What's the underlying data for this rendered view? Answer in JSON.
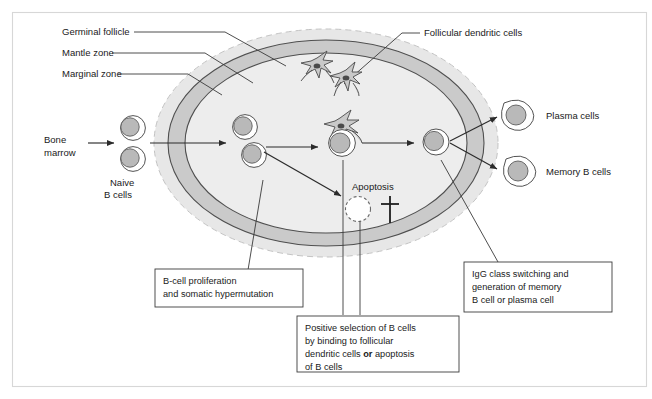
{
  "figure": {
    "background": "#ffffff",
    "frame_color": "#d7d7d7"
  },
  "zones": {
    "marginal": {
      "label": "Marginal zone",
      "fill": "#e6e6e6",
      "stroke": "#bdbdbd",
      "style": "dashed"
    },
    "mantle": {
      "label": "Mantle zone",
      "fill": "#c9c9c9",
      "stroke": "#555555",
      "style": "solid"
    },
    "germinal": {
      "label": "Germinal follicle",
      "fill": "#ededed",
      "stroke": "#555555",
      "style": "solid"
    }
  },
  "labels": {
    "germinal_follicle": "Germinal follicle",
    "mantle_zone": "Mantle zone",
    "marginal_zone": "Marginal zone",
    "follicular_dendritic_cells": "Follicular dendritic cells",
    "bone_marrow_line1": "Bone",
    "bone_marrow_line2": "marrow",
    "naive_line1": "Naive",
    "naive_line2": "B cells",
    "apoptosis": "Apoptosis",
    "plasma_cells": "Plasma cells",
    "memory_b_cells": "Memory B cells"
  },
  "boxes": {
    "proliferation": {
      "lines": [
        "B-cell proliferation",
        "and somatic hypermutation"
      ]
    },
    "positive_selection": {
      "lines": [
        {
          "text": "Positive selection of B cells"
        },
        {
          "text": "by binding to follicular"
        },
        {
          "pre": "dendritic cells ",
          "bold": "or",
          "post": " apoptosis"
        },
        {
          "text": "of B cells"
        }
      ]
    },
    "igg_switching": {
      "lines": [
        "IgG class switching and",
        "generation of memory",
        "B cell or plasma cell"
      ]
    }
  },
  "icons": {
    "death_cross": "dagger-cross-icon",
    "dendritic": "dendritic-cell-icon",
    "b_cell": "b-cell-icon",
    "apoptotic_cell": "apoptotic-cell-icon"
  },
  "cells": {
    "naive": [
      {
        "cx": 131,
        "cy": 127
      },
      {
        "cx": 131,
        "cy": 159
      }
    ],
    "follicle_entry": [
      {
        "cx": 243,
        "cy": 126
      },
      {
        "cx": 252,
        "cy": 154
      }
    ],
    "centre": {
      "cx": 340,
      "cy": 143
    },
    "exit": {
      "cx": 434,
      "cy": 141
    },
    "plasma": {
      "cx": 516,
      "cy": 115
    },
    "memory": {
      "cx": 518,
      "cy": 171
    },
    "apoptotic": {
      "cx": 358,
      "cy": 207
    },
    "dendritic_top": [
      {
        "cx": 317,
        "cy": 66
      },
      {
        "cx": 346,
        "cy": 78
      }
    ]
  }
}
